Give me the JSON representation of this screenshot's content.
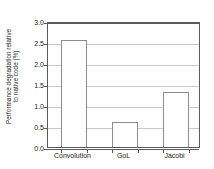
{
  "chart_data": {
    "type": "bar",
    "title": "",
    "xlabel": "",
    "ylabel": "Performance degradation relative to native code (%)",
    "ylabel_line1": "Performance degradation relative",
    "ylabel_line2": "to native code (%)",
    "categories": [
      "Convolution",
      "GoL",
      "Jacobi"
    ],
    "values": [
      2.55,
      0.6,
      1.32
    ],
    "ylim": [
      0.0,
      3.0
    ],
    "yticks": [
      "0.0",
      "0.5",
      "1.0",
      "1.5",
      "2.0",
      "2.5",
      "3.0"
    ],
    "ytick_values": [
      0.0,
      0.5,
      1.0,
      1.5,
      2.0,
      2.5,
      3.0
    ],
    "grid": true,
    "grid_axis": "y",
    "legend": false,
    "legend_position": "none",
    "bar_fill_color": "#ffffff",
    "bar_edge_color": "#8c8c8c",
    "grid_color": "#c8c8c8",
    "axis_color": "#5a5a5a",
    "text_color": "#1c1c1c",
    "background_color": "#ffffff"
  }
}
